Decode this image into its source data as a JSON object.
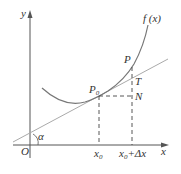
{
  "diagram": {
    "axes": {
      "x_label": "x",
      "y_label": "y",
      "origin_label": "O"
    },
    "curve_label": "f (x)",
    "points": {
      "p0": {
        "base": "P",
        "sub": "0"
      },
      "p": "P",
      "t": "T",
      "n": "N"
    },
    "angle_label": "α",
    "ticks": {
      "x0": {
        "base": "x",
        "sub": "0"
      },
      "x0_dx": {
        "base": "x",
        "sub": "0",
        "suffix": "+Δx"
      }
    },
    "colors": {
      "curve": "#777777",
      "tangent": "#aaaaaa",
      "axis": "#555555",
      "dash": "#444444"
    }
  }
}
